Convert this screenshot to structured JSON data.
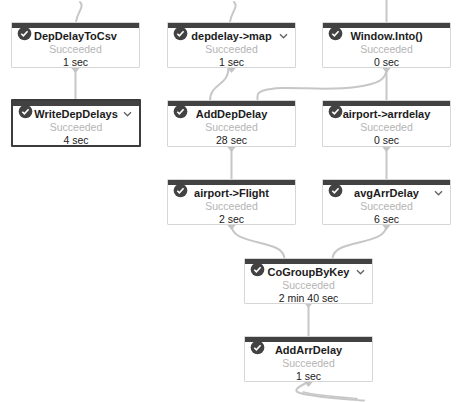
{
  "graph": {
    "title": "Dataflow job graph",
    "colors": {
      "node_top_bar": "#424242",
      "edge": "#c7c7c7",
      "node_border": "#d6d6d6",
      "selected_border": "#3c3c3c",
      "status_text": "#b4b4b4"
    },
    "nodes": [
      {
        "id": "DepDelayToCsv",
        "label": "DepDelayToCsv",
        "status": "Succeeded",
        "duration": "1 sec",
        "expandable": false,
        "selected": false
      },
      {
        "id": "depdelay-map",
        "label": "depdelay->map",
        "status": "Succeeded",
        "duration": "1 sec",
        "expandable": true,
        "selected": false
      },
      {
        "id": "Window-Into",
        "label": "Window.Into()",
        "status": "Succeeded",
        "duration": "0 sec",
        "expandable": false,
        "selected": false
      },
      {
        "id": "WriteDepDelays",
        "label": "WriteDepDelays",
        "status": "Succeeded",
        "duration": "4 sec",
        "expandable": true,
        "selected": true
      },
      {
        "id": "AddDepDelay",
        "label": "AddDepDelay",
        "status": "Succeeded",
        "duration": "28 sec",
        "expandable": false,
        "selected": false
      },
      {
        "id": "airport-arrdelay",
        "label": "airport->arrdelay",
        "status": "Succeeded",
        "duration": "0 sec",
        "expandable": false,
        "selected": false
      },
      {
        "id": "airport-Flight",
        "label": "airport->Flight",
        "status": "Succeeded",
        "duration": "2 sec",
        "expandable": false,
        "selected": false
      },
      {
        "id": "avgArrDelay",
        "label": "avgArrDelay",
        "status": "Succeeded",
        "duration": "6 sec",
        "expandable": true,
        "selected": false
      },
      {
        "id": "CoGroupByKey",
        "label": "CoGroupByKey",
        "status": "Succeeded",
        "duration": "2 min 40 sec",
        "expandable": true,
        "selected": false
      },
      {
        "id": "AddArrDelay",
        "label": "AddArrDelay",
        "status": "Succeeded",
        "duration": "1 sec",
        "expandable": false,
        "selected": false
      }
    ],
    "edges": [
      {
        "from": "(input)",
        "to": "DepDelayToCsv"
      },
      {
        "from": "(input)",
        "to": "depdelay->map"
      },
      {
        "from": "(input)",
        "to": "Window.Into()"
      },
      {
        "from": "DepDelayToCsv",
        "to": "WriteDepDelays"
      },
      {
        "from": "depdelay->map",
        "to": "AddDepDelay"
      },
      {
        "from": "Window.Into()",
        "to": "AddDepDelay"
      },
      {
        "from": "Window.Into()",
        "to": "airport->arrdelay"
      },
      {
        "from": "AddDepDelay",
        "to": "airport->Flight"
      },
      {
        "from": "airport->arrdelay",
        "to": "avgArrDelay"
      },
      {
        "from": "airport->Flight",
        "to": "CoGroupByKey"
      },
      {
        "from": "avgArrDelay",
        "to": "CoGroupByKey"
      },
      {
        "from": "CoGroupByKey",
        "to": "AddArrDelay"
      },
      {
        "from": "AddArrDelay",
        "to": "(output)"
      }
    ]
  }
}
